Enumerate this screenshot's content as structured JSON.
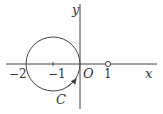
{
  "figure": {
    "x_axis_label": "x",
    "y_axis_label": "y",
    "origin_label": "O",
    "curve_label": "C",
    "ticks": {
      "neg2": "−2",
      "neg1": "−1",
      "one": "1"
    },
    "circle": {
      "center": [
        -1,
        0
      ],
      "radius": 1,
      "direction": "counterclockwise"
    },
    "open_point": [
      1,
      0
    ],
    "stroke_color": "#444444"
  }
}
